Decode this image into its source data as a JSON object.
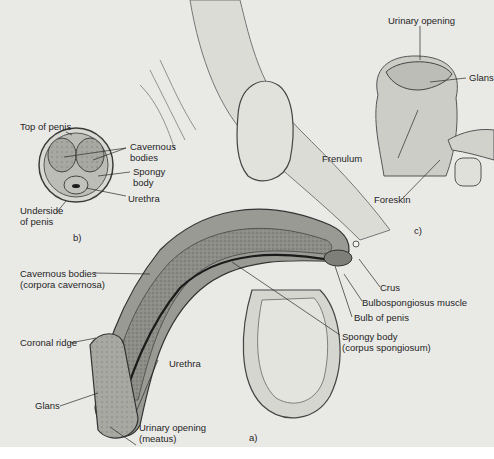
{
  "figure": {
    "panels": [
      {
        "id": "a",
        "label": "a)",
        "title": "Side (sagittal) section"
      },
      {
        "id": "b",
        "label": "b)",
        "title": "Cross-section"
      },
      {
        "id": "c",
        "label": "c)",
        "title": "External view"
      }
    ],
    "panel_b_labels": {
      "top": "Top of penis",
      "cavernous": "Cavernous\nbodies",
      "spongy": "Spongy\nbody",
      "urethra": "Urethra",
      "underside": "Underside\nof penis",
      "panel_label": "b)"
    },
    "panel_c_labels": {
      "urinary_opening": "Urinary opening",
      "glans": "Glans",
      "frenulum": "Frenulum",
      "foreskin": "Foreskin",
      "panel_label": "c)"
    },
    "panel_a_labels": {
      "cavernous": "Cavernous bodies\n(corpora cavernosa)",
      "coronal_ridge": "Coronal ridge",
      "glans": "Glans",
      "urethra": "Urethra",
      "urinary_opening": "Urinary opening\n(meatus)",
      "spongy": "Spongy body\n(corpus spongiosum)",
      "bulb": "Bulb of penis",
      "bulbospongiosus": "Bulbospongiosus muscle",
      "crus": "Crus",
      "panel_label": "a)"
    },
    "colors": {
      "background": "#e9e9e6",
      "tissue_dark": "#6f6f6b",
      "tissue_mid": "#9a9a95",
      "tissue_light": "#cfcfca",
      "outline": "#3a3a38",
      "leader": "#2a2a2a"
    }
  }
}
